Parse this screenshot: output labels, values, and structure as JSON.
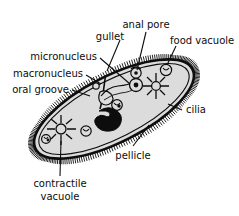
{
  "figure": {
    "background_color": "#ffffff",
    "ink_color": "#0d0d0d",
    "cytoplasm_color": "#dcdcdc",
    "nucleus_color": "#0d0d0d"
  },
  "labels": [
    {
      "id": "anal-pore",
      "text": "anal pore"
    },
    {
      "id": "gullet",
      "text": "gullet"
    },
    {
      "id": "food-vacuole",
      "text": "food vacuole"
    },
    {
      "id": "micronucleus",
      "text": "micronucleus"
    },
    {
      "id": "macronucleus",
      "text": "macronucleus"
    },
    {
      "id": "oral-groove",
      "text": "oral groove"
    },
    {
      "id": "cilia",
      "text": "cilia"
    },
    {
      "id": "pellicle",
      "text": "pellicle"
    },
    {
      "id": "contractile-line1",
      "text": "contractile"
    },
    {
      "id": "contractile-line2",
      "text": "vacuole"
    }
  ],
  "structures": [
    {
      "id": "cell-body",
      "name": "paramecium-body"
    },
    {
      "id": "macronucleus-shape",
      "name": "macronucleus"
    },
    {
      "id": "micronucleus-shape",
      "name": "micronucleus"
    },
    {
      "id": "gullet-shape",
      "name": "gullet"
    },
    {
      "id": "oral-groove-shape",
      "name": "oral-groove"
    },
    {
      "id": "contractile-upper",
      "name": "contractile-vacuole-upper"
    },
    {
      "id": "contractile-lower",
      "name": "contractile-vacuole-lower"
    },
    {
      "id": "cilia-fringe",
      "name": "cilia-fringe"
    },
    {
      "id": "pellicle-membrane",
      "name": "pellicle-membrane"
    },
    {
      "id": "food-vacuoles",
      "name": "food-vacuoles"
    }
  ]
}
